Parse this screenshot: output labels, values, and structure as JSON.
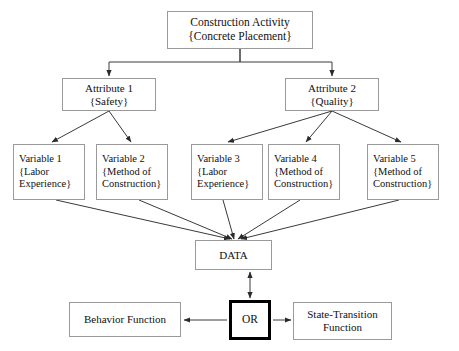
{
  "diagram": {
    "colors": {
      "box_border": "#9a9a9a",
      "emphasis_border": "#000000",
      "connector": "#3a3a3a",
      "background": "#ffffff",
      "text": "#111111"
    },
    "nodes": {
      "root": {
        "name": "construction-activity",
        "line1": "Construction Activity",
        "line2": "{Concrete Placement}"
      },
      "attribute1": {
        "name": "attribute-1",
        "line1": "Attribute 1",
        "line2": "{Safety}"
      },
      "attribute2": {
        "name": "attribute-2",
        "line1": "Attribute 2",
        "line2": "{Quality}"
      },
      "variable1": {
        "name": "variable-1",
        "line1": "Variable 1",
        "line2": "{Labor",
        "line3": "Experience}"
      },
      "variable2": {
        "name": "variable-2",
        "line1": "Variable 2",
        "line2": "{Method of",
        "line3": "Construction}"
      },
      "variable3": {
        "name": "variable-3",
        "line1": "Variable 3",
        "line2": "{Labor",
        "line3": "Experience}"
      },
      "variable4": {
        "name": "variable-4",
        "line1": "Variable 4",
        "line2": "{Method of",
        "line3": "Construction}"
      },
      "variable5": {
        "name": "variable-5",
        "line1": "Variable 5",
        "line2": "{Method of",
        "line3": "Construction}"
      },
      "data": {
        "name": "data",
        "label": "DATA"
      },
      "or": {
        "name": "or-operator",
        "label": "OR"
      },
      "behavior": {
        "name": "behavior-function",
        "label": "Behavior Function"
      },
      "state": {
        "name": "state-transition-function",
        "line1": "State-Transition",
        "line2": "Function"
      }
    },
    "edges": [
      {
        "from": "construction-activity",
        "to": "attribute-1",
        "style": "orthogonal",
        "arrow": "end"
      },
      {
        "from": "construction-activity",
        "to": "attribute-2",
        "style": "orthogonal",
        "arrow": "end"
      },
      {
        "from": "attribute-1",
        "to": "variable-1",
        "style": "diagonal",
        "arrow": "end"
      },
      {
        "from": "attribute-1",
        "to": "variable-2",
        "style": "diagonal",
        "arrow": "end"
      },
      {
        "from": "attribute-2",
        "to": "variable-3",
        "style": "diagonal",
        "arrow": "end"
      },
      {
        "from": "attribute-2",
        "to": "variable-4",
        "style": "diagonal",
        "arrow": "end"
      },
      {
        "from": "attribute-2",
        "to": "variable-5",
        "style": "diagonal",
        "arrow": "end"
      },
      {
        "from": "variable-1",
        "to": "data",
        "style": "diagonal",
        "arrow": "end"
      },
      {
        "from": "variable-2",
        "to": "data",
        "style": "diagonal",
        "arrow": "end"
      },
      {
        "from": "variable-3",
        "to": "data",
        "style": "diagonal",
        "arrow": "end"
      },
      {
        "from": "variable-4",
        "to": "data",
        "style": "diagonal",
        "arrow": "end"
      },
      {
        "from": "variable-5",
        "to": "data",
        "style": "diagonal",
        "arrow": "end"
      },
      {
        "from": "data",
        "to": "or-operator",
        "style": "vertical",
        "arrow": "both"
      },
      {
        "from": "or-operator",
        "to": "behavior-function",
        "style": "horizontal",
        "arrow": "end"
      },
      {
        "from": "or-operator",
        "to": "state-transition-function",
        "style": "horizontal",
        "arrow": "end"
      }
    ]
  }
}
